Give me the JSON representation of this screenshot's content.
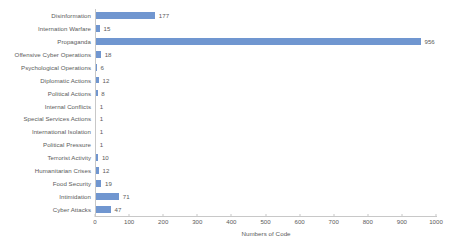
{
  "chart_data": {
    "type": "bar",
    "orientation": "horizontal",
    "title": "",
    "subtitle": "",
    "xlabel": "Numbers of Code",
    "ylabel": "",
    "xlim": [
      0,
      1000
    ],
    "xticks": [
      0,
      100,
      200,
      300,
      400,
      500,
      600,
      700,
      800,
      900,
      1000
    ],
    "xtick_labels": [
      "0",
      "100",
      "200",
      "300",
      "400",
      "500",
      "600",
      "700",
      "800",
      "900",
      "1000"
    ],
    "grid": false,
    "legend": false,
    "data_labels": true,
    "bar_color": "#7096d0",
    "background_color": "#ffffff",
    "text_color": "#5a5a5a",
    "axis_color": "#c8c8c8",
    "categories": [
      "Disinformation",
      "Internation Warfare",
      "Propaganda",
      "Offensive Cyber Operations",
      "Psychological Operations",
      "Diplomatic Actions",
      "Political Actions",
      "Internal Conflicts",
      "Special Services Actions",
      "International Isolation",
      "Political Pressure",
      "Terrorist Activity",
      "Humanitarian Crises",
      "Food Security",
      "Intimidation",
      "Cyber Attacks"
    ],
    "values": [
      177,
      15,
      956,
      18,
      6,
      12,
      8,
      1,
      1,
      1,
      1,
      10,
      12,
      19,
      71,
      47
    ],
    "value_labels": [
      "177",
      "15",
      "956",
      "18",
      "6",
      "12",
      "8",
      "1",
      "1",
      "1",
      "1",
      "10",
      "12",
      "19",
      "71",
      "47"
    ]
  }
}
